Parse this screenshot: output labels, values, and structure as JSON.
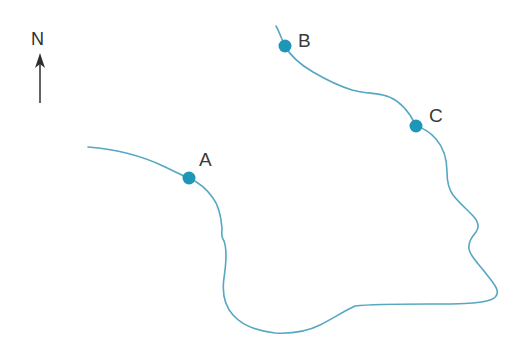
{
  "figure": {
    "type": "map-diagram",
    "background_color": "#ffffff",
    "width": 513,
    "height": 358
  },
  "colors": {
    "line": "#55a7c2",
    "dot": "#1e96b8",
    "label_text": "#3a3a3a",
    "compass_text": "#2e2e2e"
  },
  "compass": {
    "name": "north-arrow",
    "label": "N",
    "label_x": 31,
    "label_y": 45,
    "shaft_x": 40,
    "shaft_top_y": 60,
    "shaft_bottom_y": 103,
    "head_points": "40,53 35,68 40,64 45,68"
  },
  "sites": [
    {
      "id": "A",
      "label": "A",
      "dot_cx": 189,
      "dot_cy": 178,
      "dot_r": 6.5,
      "label_x": 199,
      "label_y": 166
    },
    {
      "id": "B",
      "label": "B",
      "dot_cx": 285,
      "dot_cy": 46,
      "dot_r": 6.5,
      "label_x": 298,
      "label_y": 47
    },
    {
      "id": "C",
      "label": "C",
      "dot_cx": 416,
      "dot_cy": 126,
      "dot_r": 6.5,
      "label_x": 429,
      "label_y": 122
    }
  ],
  "paths": [
    {
      "name": "western-boundary-through-a",
      "d": "M 88 147 C 112 149 140 155 163 166 C 176 172 183 176 189 178 C 198 182 206 188 213 198 C 219 206 221 216 222 228 C 222 233 221 236 223 239 C 225 242 226 248 226 256 C 226 264 225 270 224 278 C 222 292 224 305 233 315 C 242 325 256 331 275 333 C 292 334 308 331 320 325 C 332 319 344 311 355 306 C 372 304 400 304 430 304 C 455 304 478 304 490 300 C 496 298 498 294 497 290 C 496 285 490 279 484 271 C 477 262 470 256 469 249 C 468 242 472 237 476 232 C 479 228 479 223 474 217 C 468 210 459 203 453 195 C 448 188 447 180 447 172 C 447 160 444 148 436 139 C 430 132 423 128 416 126"
    },
    {
      "name": "northern-boundary-through-b-c",
      "d": "M 276 26 C 279 31 282 40 285 46 C 291 57 301 65 313 72 C 325 79 339 86 352 90 C 363 93 374 93 383 95 C 393 97 403 105 410 115 C 413 120 415 124 416 126"
    }
  ]
}
